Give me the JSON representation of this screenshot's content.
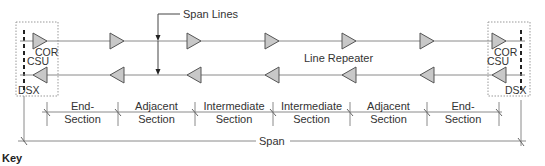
{
  "diagram": {
    "labels": {
      "span_lines": "Span Lines",
      "line_repeater": "Line Repeater",
      "span": "Span",
      "key": "Key"
    },
    "terminals": {
      "left": {
        "cor": "COR",
        "csu": "CSU",
        "dsx": "DSX"
      },
      "right": {
        "cor": "COR",
        "csu": "CSU",
        "dsx": "DSX"
      }
    },
    "sections": [
      {
        "line1": "End-",
        "line2": "Section"
      },
      {
        "line1": "Adjacent",
        "line2": "Section"
      },
      {
        "line1": "Intermediate",
        "line2": "Section"
      },
      {
        "line1": "Intermediate",
        "line2": "Section"
      },
      {
        "line1": "Adjacent",
        "line2": "Section"
      },
      {
        "line1": "End-",
        "line2": "Section"
      }
    ],
    "repeaters_per_line": 5,
    "colors": {
      "line": "#8a8a8a",
      "repeater_fill": "#c8c8c8",
      "repeater_stroke": "#555555",
      "text": "#333333",
      "box_border": "#999999"
    }
  }
}
